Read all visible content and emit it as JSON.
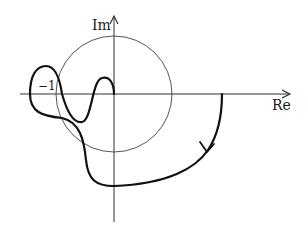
{
  "diagram": {
    "type": "nyquist-plot",
    "axes": {
      "real_label": "Re",
      "imag_label": "Im"
    },
    "annotations": {
      "critical_point_label": "−1"
    },
    "unit_circle": {
      "center": [
        114,
        94
      ],
      "radius": 58
    },
    "colors": {
      "axis": "#333333",
      "circle": "#555555",
      "curve": "#111111",
      "text": "#1a1a1a"
    }
  }
}
